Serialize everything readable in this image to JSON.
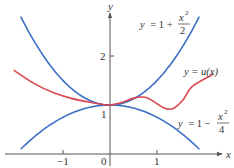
{
  "chart_data": {
    "type": "line",
    "title": "",
    "xlabel": "x",
    "ylabel": "y",
    "xlim": [
      -2.2,
      2.6
    ],
    "ylim": [
      -0.3,
      3.1
    ],
    "grid": false,
    "legend": "none (inline curve labels)",
    "x_ticks": [
      {
        "value": -1,
        "label": "−1"
      },
      {
        "value": 0,
        "label": "0"
      },
      {
        "value": 1,
        "label": "1"
      }
    ],
    "y_ticks": [
      {
        "value": 1,
        "label": "1"
      },
      {
        "value": 2,
        "label": "2"
      }
    ],
    "series": [
      {
        "name": "upper bound",
        "label": "y = 1 + x²/2",
        "expression": "1 + x^2/2",
        "color": "#3b6fc4",
        "x_range": [
          -1.9,
          1.9
        ],
        "x": [
          -1.9,
          -1.5,
          -1.0,
          -0.5,
          0,
          0.5,
          1.0,
          1.5,
          1.9
        ],
        "values": [
          2.805,
          2.125,
          1.5,
          1.125,
          1.0,
          1.125,
          1.5,
          2.125,
          2.805
        ]
      },
      {
        "name": "lower bound",
        "label": "y = 1 − x²/4",
        "expression": "1 - x^2/4",
        "color": "#3b6fc4",
        "x_range": [
          -1.9,
          1.9
        ],
        "x": [
          -1.9,
          -1.5,
          -1.0,
          -0.5,
          0,
          0.5,
          1.0,
          1.5,
          1.9
        ],
        "values": [
          0.0975,
          0.4375,
          0.75,
          0.9375,
          1.0,
          0.9375,
          0.75,
          0.4375,
          0.0975
        ]
      },
      {
        "name": "u(x)",
        "label": "y = u(x)",
        "color": "#d9474f",
        "x": [
          -2.05,
          -1.6,
          -1.2,
          -0.8,
          -0.4,
          -0.15,
          0,
          0.25,
          0.5,
          0.75,
          0.95,
          1.15,
          1.35,
          1.55,
          1.75,
          2.2
        ],
        "values": [
          1.71,
          1.43,
          1.25,
          1.13,
          1.05,
          1.01,
          1.0,
          1.05,
          1.14,
          1.16,
          1.06,
          0.94,
          0.93,
          1.1,
          1.38,
          1.63
        ]
      }
    ],
    "annotations": [
      {
        "text": "y = 1 + x²/2",
        "near": "upper blue curve, top right"
      },
      {
        "text": "y = u(x)",
        "near": "red curve, right end"
      },
      {
        "text": "y = 1 − x²/4",
        "near": "lower blue curve, bottom right"
      }
    ]
  },
  "labels": {
    "y_axis": "y",
    "x_axis": "x",
    "tick_neg1": "−1",
    "tick_0": "0",
    "tick_1_x": "1",
    "tick_1_y": "1",
    "tick_2_y": "2",
    "upper_y": "y",
    "upper_eq": "= 1 +",
    "upper_num": "x",
    "upper_exp": "2",
    "upper_den": "2",
    "u_label_prefix": "y = ",
    "u_label_fn": "u(x)",
    "lower_y": "y",
    "lower_eq": "= 1 −",
    "lower_num": "x",
    "lower_exp": "2",
    "lower_den": "4"
  },
  "colors": {
    "axis": "#555555",
    "blue": "#3b6fc4",
    "red": "#d9474f"
  }
}
